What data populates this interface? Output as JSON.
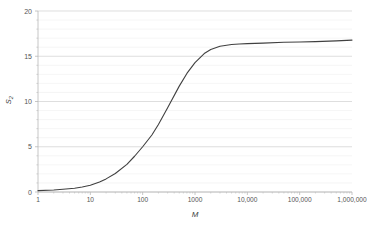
{
  "chart_data": {
    "type": "line",
    "title": "",
    "xlabel": "M",
    "ylabel": "S2",
    "ylabel_base": "S",
    "ylabel_sub": "2",
    "xscale": "log",
    "yscale": "linear",
    "xlim": [
      1,
      1000000
    ],
    "ylim": [
      0,
      20
    ],
    "grid": true,
    "grid_major_y": [
      0,
      5,
      10,
      15,
      20
    ],
    "grid_minor_y_step": 1,
    "legend": null,
    "legend_position": "none",
    "line_color": "#404040",
    "grid_major_color": "#d0d0d0",
    "grid_minor_color": "#efefef",
    "axis_color": "#b8b8b8",
    "xticks": [
      1,
      10,
      100,
      1000,
      10000,
      100000,
      1000000
    ],
    "xtick_labels": [
      "1",
      "10",
      "100",
      "1000",
      "10,000",
      "100,000",
      "1,000,000"
    ],
    "yticks": [
      0,
      5,
      10,
      15,
      20
    ],
    "ytick_labels": [
      "0",
      "5",
      "10",
      "15",
      "20"
    ],
    "series": [
      {
        "name": "S2 vs M",
        "x": [
          1,
          2,
          3,
          5,
          7,
          10,
          15,
          20,
          30,
          50,
          70,
          100,
          150,
          200,
          300,
          500,
          700,
          1000,
          1500,
          2000,
          3000,
          5000,
          7000,
          10000,
          20000,
          50000,
          100000,
          200000,
          500000,
          1000000
        ],
        "y": [
          0.15,
          0.22,
          0.3,
          0.42,
          0.55,
          0.75,
          1.1,
          1.45,
          2.05,
          3.05,
          3.95,
          5.0,
          6.3,
          7.45,
          9.3,
          11.7,
          13.1,
          14.3,
          15.3,
          15.75,
          16.1,
          16.3,
          16.35,
          16.4,
          16.45,
          16.55,
          16.58,
          16.62,
          16.7,
          16.78
        ]
      }
    ]
  },
  "plot_geometry": {
    "left": 38,
    "right": 352,
    "top": 11,
    "bottom": 192
  }
}
